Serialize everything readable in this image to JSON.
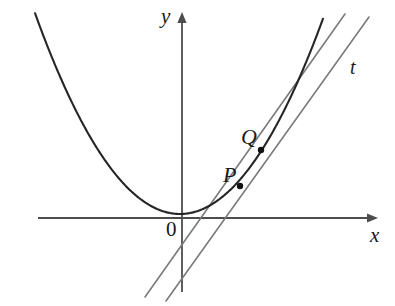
{
  "figure": {
    "background_color": "#ffffff",
    "width": 395,
    "height": 306
  },
  "axes": {
    "x_axis": {
      "label": "x",
      "color": "#4d4d4d",
      "start": [
        38,
        218
      ],
      "end": [
        378,
        218
      ],
      "arrow": "right"
    },
    "y_axis": {
      "label": "y",
      "color": "#4d4d4d",
      "start": [
        182,
        292
      ],
      "end": [
        182,
        12
      ],
      "arrow": "up"
    },
    "origin": {
      "label": "0",
      "position": [
        176,
        218
      ]
    }
  },
  "curve": {
    "name": "parabola",
    "color": "#262626",
    "stroke_width": 2.1,
    "vertex": [
      180,
      214
    ],
    "coefficient": 0.00955,
    "x_from": 35,
    "x_to": 323
  },
  "lines": [
    {
      "name": "secant-PQ",
      "label": "",
      "color": "#7a7a7a",
      "stroke_width": 1.6,
      "from": [
        145,
        297
      ],
      "to": [
        345,
        14
      ]
    },
    {
      "name": "tangent-t",
      "label": "t",
      "color": "#7a7a7a",
      "stroke_width": 1.6,
      "from": [
        166,
        301
      ],
      "to": [
        369,
        17
      ]
    }
  ],
  "points": [
    {
      "name": "P",
      "label": "P",
      "position": [
        240,
        186
      ],
      "radius": 3.2,
      "color": "#111111"
    },
    {
      "name": "Q",
      "label": "Q",
      "position": [
        261,
        150
      ],
      "radius": 3.2,
      "color": "#111111"
    }
  ],
  "chart_data": {
    "type": "line",
    "title": "",
    "xlabel": "x",
    "ylabel": "y",
    "grid": false,
    "legend": null,
    "annotations": [
      "P",
      "Q",
      "t",
      "0"
    ],
    "series": [
      {
        "name": "parabola",
        "kind": "curve"
      },
      {
        "name": "secant through P and Q",
        "kind": "line"
      },
      {
        "name": "tangent t at P",
        "kind": "line"
      }
    ]
  }
}
